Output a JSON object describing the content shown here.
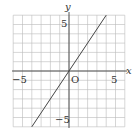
{
  "chart_data": {
    "type": "line",
    "title": "",
    "xlabel": "x",
    "ylabel": "y",
    "xlim": [
      -6,
      6
    ],
    "ylim": [
      -6,
      6
    ],
    "grid": true,
    "origin_label": "O",
    "x_tick_labels": [
      {
        "value": -5,
        "label": "−5"
      },
      {
        "value": 5,
        "label": "5"
      }
    ],
    "y_tick_labels": [
      {
        "value": 5,
        "label": "5"
      },
      {
        "value": -5,
        "label": "−5"
      }
    ],
    "series": [
      {
        "name": "y = 3/2 x",
        "x": [
          -4,
          4
        ],
        "y": [
          -6,
          6
        ]
      }
    ]
  },
  "labels": {
    "x_axis": "x",
    "y_axis": "y",
    "origin": "O",
    "x_neg5": "−5",
    "x_pos5": "5",
    "y_pos5": "5",
    "y_neg5": "−5"
  }
}
